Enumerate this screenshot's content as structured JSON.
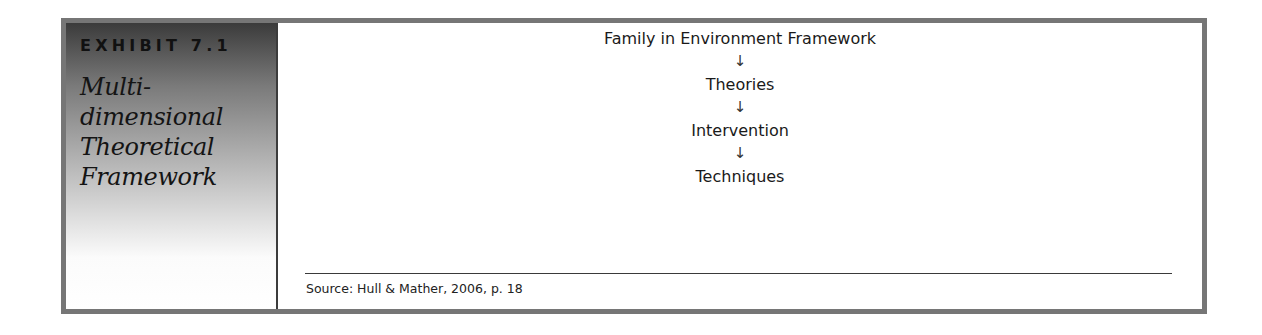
{
  "exhibit": {
    "number": "EXHIBIT 7.1",
    "title_lines": [
      "Multi-",
      "dimensional",
      "Theoretical",
      "Framework"
    ]
  },
  "diagram": {
    "steps": [
      {
        "label": "Family in Environment Framework"
      },
      {
        "label": "Theories"
      },
      {
        "label": "Intervention"
      },
      {
        "label": "Techniques"
      }
    ],
    "arrow_glyph": "↓"
  },
  "source": {
    "text": "Source: Hull & Mather, 2006, p. 18"
  },
  "colors": {
    "border": "#767676",
    "panel_top": "#3b3b3b",
    "panel_bottom": "#ffffff"
  }
}
